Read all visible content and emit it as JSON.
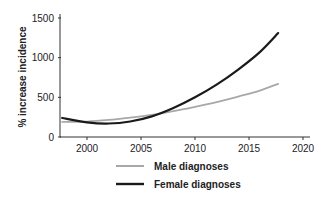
{
  "chart_data": {
    "type": "line",
    "title": "",
    "xlabel": "",
    "ylabel": "% increase incidence",
    "xlim": [
      1997.5,
      2021
    ],
    "ylim": [
      0,
      1500
    ],
    "x_ticks": [
      2000,
      2005,
      2010,
      2015,
      2020
    ],
    "y_ticks": [
      0,
      500,
      1000,
      1500
    ],
    "grid": false,
    "legend_position": "bottom",
    "x": [
      1997.7,
      2000,
      2002,
      2004,
      2006,
      2008,
      2010,
      2012,
      2014,
      2016,
      2017.7
    ],
    "series": [
      {
        "name": "Male diagnoses",
        "color": "#a8a8a8",
        "values": [
          190,
          195,
          215,
          245,
          280,
          325,
          380,
          440,
          510,
          585,
          670
        ]
      },
      {
        "name": "Female diagnoses",
        "color": "#1a1a1a",
        "values": [
          240,
          185,
          170,
          195,
          260,
          365,
          500,
          660,
          850,
          1070,
          1310
        ]
      }
    ]
  }
}
